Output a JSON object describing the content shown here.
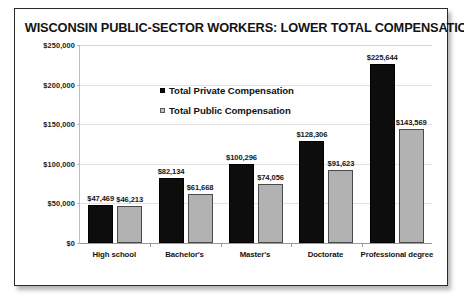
{
  "card": {
    "title": "WISCONSIN PUBLIC-SECTOR WORKERS: LOWER TOTAL COMPENSATION"
  },
  "legend": {
    "private_label": "Total Private Compensation",
    "public_label": "Total Public Compensation"
  },
  "axis": {
    "y_ticks": [
      "$250,000",
      "$200,000",
      "$150,000",
      "$100,000",
      "$50,000",
      "$0"
    ]
  },
  "colors": {
    "private_bar": "#0d0d0d",
    "public_bar": "#b2b2b2",
    "frame": "#2b2b2b",
    "gridline": "#e2e2e2",
    "background": "#ffffff"
  },
  "chart_data": {
    "type": "bar",
    "title": "WISCONSIN PUBLIC-SECTOR WORKERS: LOWER TOTAL COMPENSATION",
    "xlabel": "",
    "ylabel": "",
    "ylim": [
      0,
      250000
    ],
    "ytick_step": 50000,
    "grid": true,
    "legend_position": "inside-upper-left",
    "categories": [
      "High school",
      "Bachelor's",
      "Master's",
      "Doctorate",
      "Professional degree"
    ],
    "series": [
      {
        "name": "Total Private Compensation",
        "color": "#0d0d0d",
        "values": [
          47469,
          82134,
          100296,
          128306,
          225644
        ],
        "data_labels": [
          "$47,469",
          "$82,134",
          "$100,296",
          "$128,306",
          "$225,644"
        ]
      },
      {
        "name": "Total Public Compensation",
        "color": "#b2b2b2",
        "values": [
          46213,
          61668,
          74056,
          91623,
          143569
        ],
        "data_labels": [
          "$46,213",
          "$61,668",
          "$74,056",
          "$91,623",
          "$143,569"
        ]
      }
    ]
  }
}
